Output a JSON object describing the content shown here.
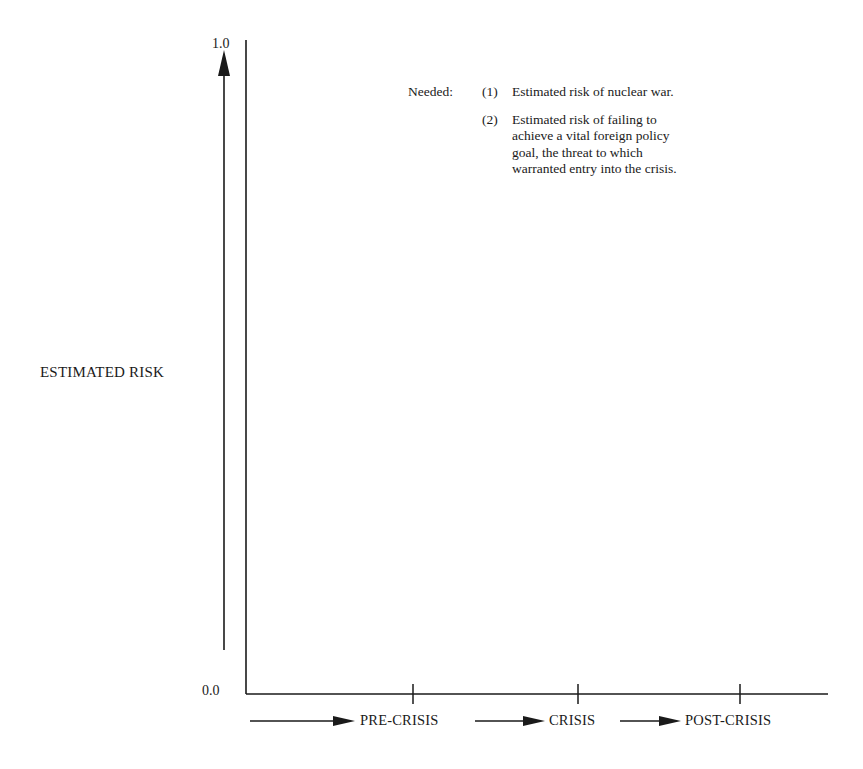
{
  "figure": {
    "y_axis": {
      "title": "ESTIMATED RISK",
      "top_label": "1.0",
      "bottom_label": "0.0",
      "range": [
        0.0,
        1.0
      ]
    },
    "x_axis": {
      "phases": [
        "PRE-CRISIS",
        "CRISIS",
        "POST-CRISIS"
      ]
    },
    "note": {
      "heading": "Needed:",
      "items": [
        {
          "number": "(1)",
          "text": "Estimated risk of nuclear war."
        },
        {
          "number": "(2)",
          "text": "Estimated risk of failing to achieve a vital foreign policy goal, the threat to which warranted entry into the crisis."
        }
      ]
    },
    "colors": {
      "ink": "#1a1a1a",
      "background": "#ffffff"
    }
  }
}
